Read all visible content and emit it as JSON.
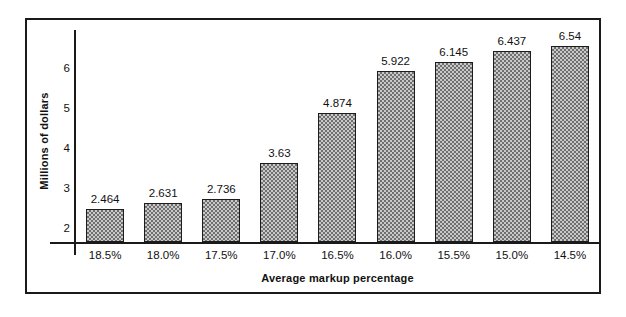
{
  "chart_data": {
    "type": "bar",
    "title": "",
    "xlabel": "Average markup percentage",
    "ylabel": "Millions of dollars",
    "categories": [
      "18.5%",
      "18.0%",
      "17.5%",
      "17.0%",
      "16.5%",
      "16.0%",
      "15.5%",
      "15.0%",
      "14.5%"
    ],
    "values": [
      2.464,
      2.631,
      2.736,
      3.63,
      4.874,
      5.922,
      6.145,
      6.437,
      6.54
    ],
    "value_labels": [
      "2.464",
      "2.631",
      "2.736",
      "3.63",
      "4.874",
      "5.922",
      "6.145",
      "6.437",
      "6.54"
    ],
    "ytick_labels": [
      "6",
      "5",
      "4",
      "3",
      "2"
    ],
    "ytick_values": [
      6,
      5,
      4,
      3,
      2
    ],
    "ylim": [
      1.625,
      6.975
    ],
    "grid": false,
    "legend": "none",
    "bar_fill_color": "#9b9b9b",
    "bar_edge_color": "#1c1c1c",
    "axis_color": "#1a1a1a",
    "text_color": "#111111",
    "background_color": "#ffffff"
  }
}
